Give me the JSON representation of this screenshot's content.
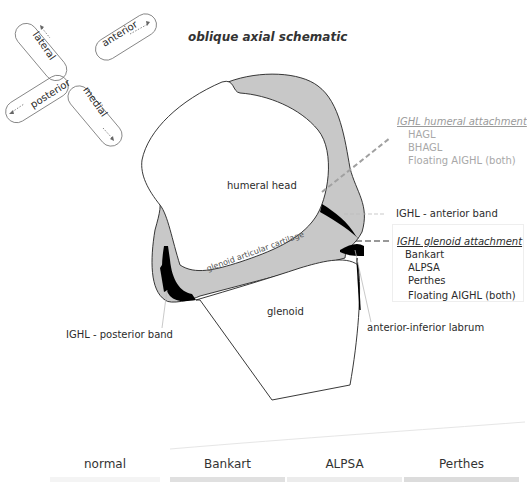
{
  "title": "oblique axial schematic",
  "orientation": {
    "lateral": "lateral",
    "anterior": "anterior",
    "posterior": "posterior",
    "medial": "medial"
  },
  "structures": {
    "humeral_head": "humeral head",
    "glenoid": "glenoid",
    "glenoid_cartilage": "glenoid articular cartilage"
  },
  "labels": {
    "ighl_anterior_band": "IGHL - anterior band",
    "ighl_posterior_band": "IGHL - posterior band",
    "anterior_inferior_labrum": "anterior-inferior labrum"
  },
  "humeral_attachment": {
    "header": "IGHL humeral attachment",
    "items": [
      "HAGL",
      "BHAGL",
      "Floating AIGHL (both)"
    ]
  },
  "glenoid_attachment": {
    "header": "IGHL glenoid attachment",
    "items": [
      "Bankart",
      "ALPSA",
      "Perthes"
    ],
    "extra": "Floating AIGHL (both)"
  },
  "tabs": [
    {
      "label": "normal"
    },
    {
      "label": "Bankart"
    },
    {
      "label": "ALPSA"
    },
    {
      "label": "Perthes"
    }
  ],
  "colors": {
    "capsule_fill": "#c8c8c8",
    "ligament": "#000000",
    "humeral_leader": "#a0a0a0"
  }
}
